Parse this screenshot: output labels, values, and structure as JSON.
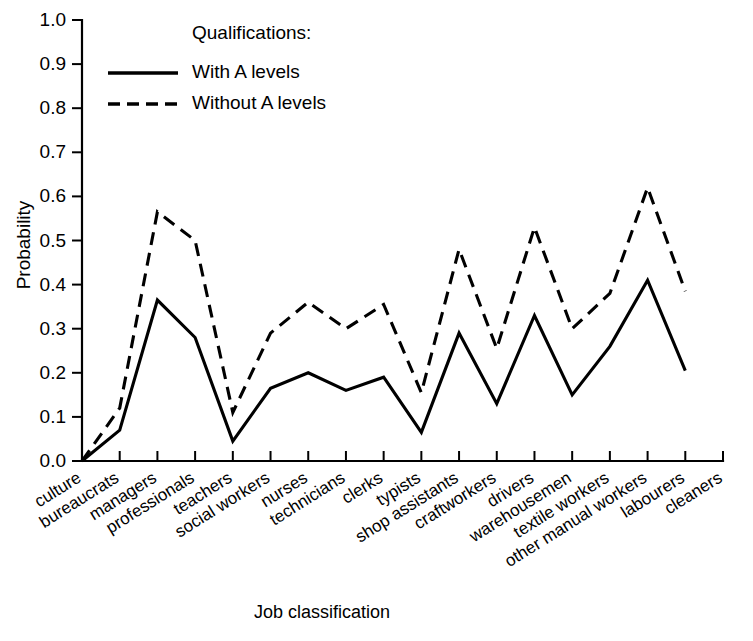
{
  "chart_data": {
    "type": "line",
    "title": "",
    "xlabel": "Job classification",
    "ylabel": "Probability",
    "ylim": [
      0.0,
      1.0
    ],
    "ytick_labels": [
      "0.0",
      "0.1",
      "0.2",
      "0.3",
      "0.4",
      "0.5",
      "0.6",
      "0.7",
      "0.8",
      "0.9",
      "1.0"
    ],
    "ytick_values": [
      0.0,
      0.1,
      0.2,
      0.3,
      0.4,
      0.5,
      0.6,
      0.7,
      0.8,
      0.9,
      1.0
    ],
    "grid": false,
    "legend_position": "upper-center",
    "legend_title": "Qualifications:",
    "categories": [
      "culture",
      "bureaucrats",
      "managers",
      "professionals",
      "teachers",
      "social workers",
      "nurses",
      "technicians",
      "clerks",
      "typists",
      "shop assistants",
      "craftworkers",
      "drivers",
      "warehousemen",
      "textile workers",
      "other manual workers",
      "labourers",
      "cleaners"
    ],
    "series": [
      {
        "name": "With A levels",
        "style": "solid",
        "values": [
          0.0,
          0.07,
          0.365,
          0.28,
          0.045,
          0.165,
          0.2,
          0.16,
          0.19,
          0.065,
          0.29,
          0.13,
          0.33,
          0.15,
          0.26,
          0.41,
          0.205,
          null
        ]
      },
      {
        "name": "Without A levels",
        "style": "dashed",
        "values": [
          0.0,
          0.12,
          0.565,
          0.5,
          0.11,
          0.29,
          0.36,
          0.3,
          0.355,
          0.155,
          0.48,
          0.255,
          0.53,
          0.3,
          0.38,
          0.62,
          0.385,
          null
        ]
      }
    ]
  },
  "legend": {
    "title": "Qualifications:",
    "entries": [
      {
        "label": "With A levels",
        "style": "solid"
      },
      {
        "label": "Without A levels",
        "style": "dashed"
      }
    ]
  },
  "axes": {
    "y_title": "Probability",
    "x_title": "Job classification"
  },
  "colors": {
    "ink": "#000000",
    "background": "#ffffff"
  }
}
